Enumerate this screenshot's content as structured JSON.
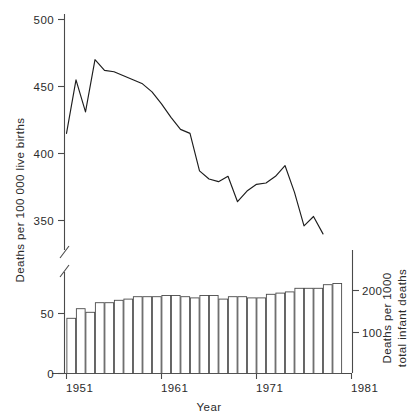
{
  "chart_data": {
    "type": "line",
    "title": "",
    "xlabel": "Year",
    "ylabel_left": "Deaths per 100 000 live births",
    "ylabel_right_line1": "Deaths per 1000",
    "ylabel_right_line2": "total infant deaths",
    "grid": false,
    "legend_position": "none",
    "axis_break": true,
    "x": [
      1951,
      1952,
      1953,
      1954,
      1955,
      1956,
      1957,
      1958,
      1959,
      1960,
      1961,
      1962,
      1963,
      1964,
      1965,
      1966,
      1967,
      1968,
      1969,
      1970,
      1971,
      1972,
      1973,
      1974,
      1975,
      1976,
      1977
    ],
    "xlim": [
      1951,
      1981
    ],
    "xticks": [
      1951,
      1961,
      1971,
      1981
    ],
    "xticklabels": [
      "1951",
      "1961",
      "1971",
      "1981"
    ],
    "upper_panel": {
      "type": "line",
      "ylim": [
        350,
        500
      ],
      "yticks": [
        350,
        400,
        450,
        500
      ],
      "yticklabels": [
        "350",
        "400",
        "450",
        "500"
      ],
      "series": [
        {
          "name": "Deaths per 100 000 live births",
          "values": [
            415,
            455,
            431,
            470,
            462,
            461,
            458,
            455,
            452,
            446,
            437,
            427,
            418,
            415,
            387,
            381,
            379,
            383,
            364,
            372,
            377,
            378,
            383,
            391,
            371,
            346,
            353,
            340
          ]
        }
      ]
    },
    "lower_panel": {
      "type": "bar",
      "ylim_left": [
        0,
        70
      ],
      "yticks_left": [
        0,
        50
      ],
      "yticklabels_left": [
        "0",
        "50"
      ],
      "ylim_right": [
        0,
        240
      ],
      "yticks_right": [
        100,
        200
      ],
      "yticklabels_right": [
        "100",
        "200"
      ],
      "series": [
        {
          "name": "Deaths per 1000 total infant deaths",
          "values": [
            46,
            54,
            51,
            59,
            59,
            61,
            62,
            64,
            64,
            64,
            65,
            65,
            64,
            63,
            65,
            65,
            62,
            64,
            64,
            63,
            63,
            66,
            67,
            68,
            71,
            71,
            71,
            74,
            75
          ]
        }
      ]
    }
  },
  "axes": {
    "left_title": "Deaths per 100 000 live births",
    "right_title_line1": "Deaths per 1000",
    "right_title_line2": "total infant deaths",
    "x_title": "Year",
    "left_ticks": [
      "500",
      "450",
      "400",
      "350",
      "50",
      "0"
    ],
    "right_ticks": [
      "200",
      "100"
    ],
    "x_ticks": [
      "1951",
      "1961",
      "1971",
      "1981"
    ]
  }
}
